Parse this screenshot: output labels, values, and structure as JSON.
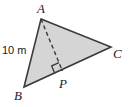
{
  "figure": {
    "type": "geometry-diagram",
    "shape": "triangle",
    "background_color": "#ffffff",
    "fill_color": "#d5d5d5",
    "stroke_color": "#3a3a3a",
    "dash_color": "#3a3a3a"
  },
  "labels": {
    "vertex_a": "A",
    "vertex_b": "B",
    "vertex_c": "C",
    "point_p": "P",
    "side_ab_measure": "10 m"
  },
  "geometry": {
    "points": {
      "A": {
        "x": 41,
        "y": 19
      },
      "B": {
        "x": 24,
        "y": 87
      },
      "C": {
        "x": 111,
        "y": 47
      },
      "P": {
        "x": 62,
        "y": 70
      }
    },
    "triangle_path": "M41,19 L111,47 L24,87 Z",
    "altitude_path": "M41,19 L62,70",
    "right_angle_marker": {
      "size": 8,
      "at": "P"
    }
  }
}
